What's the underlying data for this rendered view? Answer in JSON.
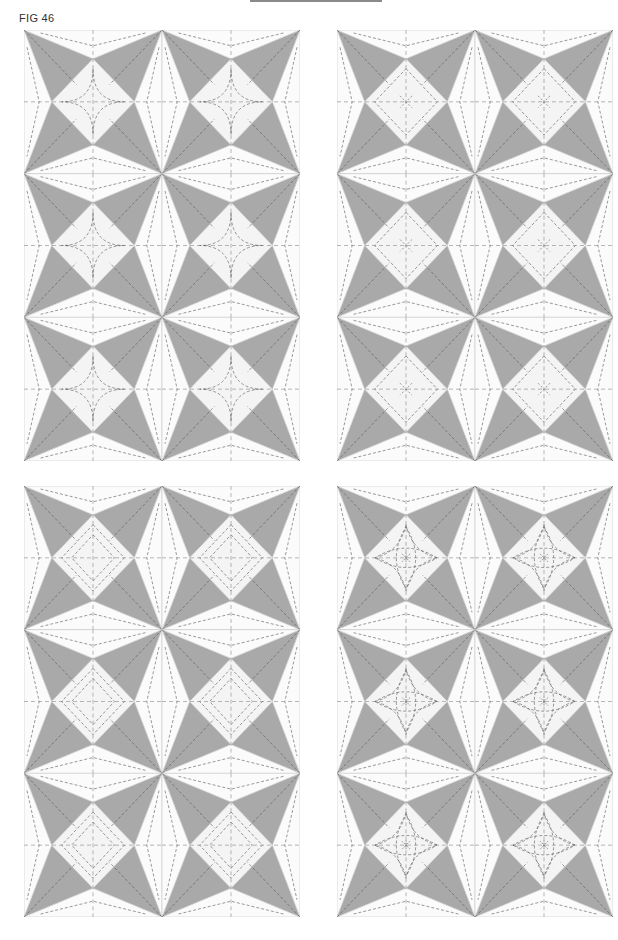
{
  "figure": {
    "label": "FIG 46",
    "colors": {
      "gray": "#a9a9a9",
      "white": "#fbfbfb",
      "diamond": "#f4f4f4",
      "stitch": "#555555",
      "outline": "#c8c8c8"
    }
  },
  "panels": [
    {
      "id": "top-left",
      "x": 24,
      "y": 30,
      "w": 276,
      "h": 431,
      "cols": 2,
      "rows": 3,
      "stitch_style": "curved-diamond"
    },
    {
      "id": "top-right",
      "x": 337,
      "y": 30,
      "w": 276,
      "h": 431,
      "cols": 2,
      "rows": 3,
      "stitch_style": "echo-diamond-cross"
    },
    {
      "id": "bottom-left",
      "x": 24,
      "y": 486,
      "w": 276,
      "h": 431,
      "cols": 2,
      "rows": 3,
      "stitch_style": "double-echo"
    },
    {
      "id": "bottom-right",
      "x": 337,
      "y": 486,
      "w": 276,
      "h": 431,
      "cols": 2,
      "rows": 3,
      "stitch_style": "flower-star"
    }
  ]
}
